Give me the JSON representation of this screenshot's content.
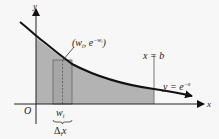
{
  "diagram": {
    "axes": {
      "x_label": "x",
      "y_label": "y",
      "origin_label": "O"
    },
    "curve": {
      "equation_lhs": "y = e",
      "equation_exp": "−x"
    },
    "point": {
      "open": "(w",
      "sub": "i",
      "mid": ", e",
      "exp_base": "−w",
      "exp_sub": "i",
      "close": ")"
    },
    "bound": {
      "label": "x = b"
    },
    "sample": {
      "label": "w",
      "label_sub": "i",
      "width_label": "Δ",
      "width_sub": "i",
      "width_var": "x"
    },
    "colors": {
      "background": "#f7f7f7",
      "shade": "#b3b3b3",
      "curve": "#111111",
      "axis": "#222222",
      "rect_stroke": "#666666",
      "bound_line": "#777777"
    }
  }
}
